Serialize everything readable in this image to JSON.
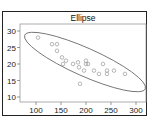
{
  "chart_data": {
    "type": "scatter",
    "title": "Ellipse",
    "xlabel": "",
    "ylabel": "",
    "xlim": [
      75,
      315
    ],
    "ylim": [
      8,
      31
    ],
    "x_ticks": [
      100,
      150,
      200,
      250,
      300
    ],
    "y_ticks": [
      10,
      15,
      20,
      25,
      30
    ],
    "grid": false,
    "legend": null,
    "series": [
      {
        "name": "points",
        "marker": "open-circle",
        "points": [
          [
            104,
            28
          ],
          [
            132,
            26
          ],
          [
            142,
            26
          ],
          [
            142,
            24
          ],
          [
            152,
            22
          ],
          [
            154,
            20
          ],
          [
            174,
            20
          ],
          [
            184,
            20.5
          ],
          [
            186,
            19
          ],
          [
            200,
            21
          ],
          [
            200,
            20
          ],
          [
            204,
            20
          ],
          [
            216,
            18
          ],
          [
            226,
            17
          ],
          [
            242,
            17
          ],
          [
            242,
            18
          ],
          [
            234,
            20
          ],
          [
            256,
            18
          ],
          [
            278,
            17
          ],
          [
            188,
            14
          ],
          [
            160,
            21
          ],
          [
            196,
            18
          ]
        ]
      }
    ],
    "annotations": [
      {
        "type": "ellipse",
        "description": "confidence ellipse around points, tilted downward from upper-left to lower-right"
      }
    ]
  },
  "colors": {
    "frame": "#222222",
    "axes": "#888888",
    "points": "#999999",
    "ellipse": "#666666"
  }
}
